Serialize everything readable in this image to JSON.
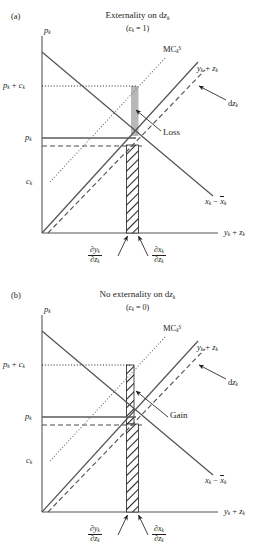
{
  "figure": {
    "type": "economics-supply-demand-diagram",
    "colors": {
      "ink": "#231f20",
      "axis": "#808080",
      "loss_fill": "#b3b3b3",
      "hatch": "#231f20"
    }
  },
  "panels": [
    {
      "tag": "(a)",
      "title_prefix": "Externality on d",
      "title_var": "z",
      "title_sub": "k",
      "subtitle": "(εk = 1)",
      "subtitle_open": "(",
      "subtitle_eps": "ε",
      "subtitle_sub": "k",
      "subtitle_eq": " = 1)",
      "yaxis_label": "p",
      "yaxis_sub": "k",
      "xaxis_label_1": "y",
      "xaxis_sub_1": "k",
      "xaxis_plus": " + ",
      "xaxis_label_2": "z",
      "xaxis_sub_2": "k",
      "ytick_high": "pk + ck",
      "ytick_mid": "pk",
      "ytick_low": "ck",
      "curves": {
        "mc_social": "MC",
        "mc_social_sub": "k",
        "mc_social_sup": "S",
        "supply": "yk + zk",
        "shift": "dzk",
        "demand": "xk − x̄k"
      },
      "area_label": "Loss",
      "area_kind": "loss",
      "bottom_left_frac": {
        "num": "∂yk",
        "den": "∂zk"
      },
      "bottom_right_frac": {
        "num": "∂xk",
        "den": "∂zk"
      }
    },
    {
      "tag": "(b)",
      "title_prefix": "No externality on d",
      "title_var": "z",
      "title_sub": "k",
      "subtitle": "(εk = 0)",
      "subtitle_open": "(",
      "subtitle_eps": "ε",
      "subtitle_sub": "k",
      "subtitle_eq": " = 0)",
      "yaxis_label": "p",
      "yaxis_sub": "k",
      "xaxis_label_1": "y",
      "xaxis_sub_1": "k",
      "xaxis_plus": " + ",
      "xaxis_label_2": "z",
      "xaxis_sub_2": "k",
      "ytick_high": "pk + ck",
      "ytick_mid": "pk",
      "ytick_low": "ck",
      "curves": {
        "mc_social": "MC",
        "mc_social_sub": "k",
        "mc_social_sup": "S",
        "supply": "yk + zk",
        "shift": "dzk",
        "demand": "xk − x̄k"
      },
      "area_label": "Gain",
      "area_kind": "gain",
      "bottom_left_frac": {
        "num": "∂yk",
        "den": "∂zk"
      },
      "bottom_right_frac": {
        "num": "∂xk",
        "den": "∂zk"
      }
    }
  ],
  "chart_data": {
    "type": "line",
    "note": "Two-panel supply-demand schematic; geometry in plot units (origin at lower-left of each axes box)",
    "axes": {
      "x_label": "y_k + z_k",
      "y_label": "p_k",
      "grid": false,
      "legend": "inline-annotations"
    },
    "y_levels": {
      "p_k_plus_c_k": 0.82,
      "p_k": 0.52,
      "p_k_shifted": 0.47,
      "c_k": 0.28
    },
    "x_levels": {
      "dy_dz": 0.465,
      "dx_dz": 0.53
    },
    "series": [
      {
        "name": "x_k - x̄_k",
        "kind": "demand",
        "style": "solid",
        "from": [
          0.0,
          1.0
        ],
        "to": [
          1.0,
          0.12
        ]
      },
      {
        "name": "y_k + z_k",
        "kind": "supply",
        "style": "solid",
        "from": [
          0.0,
          0.0
        ],
        "to": [
          0.88,
          0.95
        ]
      },
      {
        "name": "dz_k",
        "kind": "supply-shifted",
        "style": "dashed",
        "from": [
          0.035,
          0.0
        ],
        "to": [
          0.92,
          0.93
        ]
      },
      {
        "name": "MC_k^S",
        "kind": "social-marginal-cost",
        "style": "dotted",
        "from": [
          0.05,
          0.28
        ],
        "to": [
          0.66,
          1.02
        ]
      }
    ]
  }
}
